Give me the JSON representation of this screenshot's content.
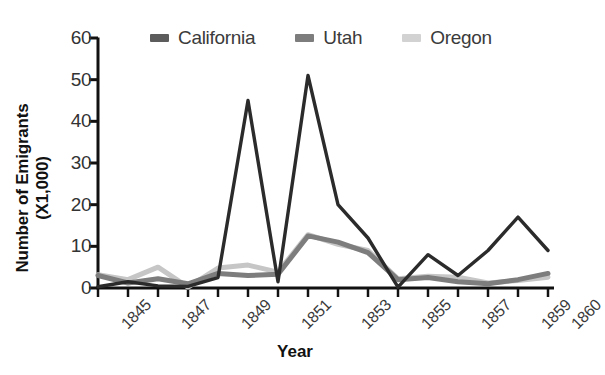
{
  "chart_data": {
    "type": "line",
    "title": "",
    "xlabel": "Year",
    "ylabel_line1": "Number of Emigrants",
    "ylabel_line2": "(X1,000)",
    "x": [
      1845,
      1846,
      1847,
      1848,
      1849,
      1850,
      1851,
      1852,
      1853,
      1854,
      1855,
      1856,
      1857,
      1858,
      1859,
      1860
    ],
    "xtick_labels": [
      "1845",
      "1847",
      "1849",
      "1851",
      "1853",
      "1855",
      "1857",
      "1859",
      "1860"
    ],
    "xtick_values": [
      1845,
      1847,
      1849,
      1851,
      1853,
      1855,
      1857,
      1859,
      1860
    ],
    "ylim": [
      0,
      60
    ],
    "xlim": [
      1845,
      1860
    ],
    "ytick_labels": [
      "0",
      "10",
      "20",
      "30",
      "40",
      "50",
      "60"
    ],
    "ytick_values": [
      0,
      10,
      20,
      30,
      40,
      50,
      60
    ],
    "grid": false,
    "legend_position": "top",
    "series": [
      {
        "name": "California",
        "color": "#2b2b2b",
        "values": [
          0.3,
          1.5,
          0.5,
          0.4,
          2.5,
          45,
          1.5,
          51,
          20,
          12,
          0.2,
          8,
          3,
          9,
          17,
          9
        ]
      },
      {
        "name": "Utah",
        "color": "#7d7d7d",
        "values": [
          3.0,
          1.2,
          2.2,
          1.0,
          3.5,
          3.0,
          3.3,
          12.5,
          11.0,
          8.5,
          2.0,
          2.5,
          1.5,
          1.0,
          2.0,
          3.5
        ]
      },
      {
        "name": "Oregon",
        "color": "#c6c6c6",
        "values": [
          3.2,
          2.0,
          5.0,
          0.2,
          4.8,
          5.5,
          3.8,
          12.8,
          10.5,
          9.0,
          2.2,
          2.8,
          2.6,
          1.2,
          1.8,
          2.6
        ]
      }
    ]
  },
  "legend": {
    "items": [
      {
        "label": "California",
        "color": "#5c5c5c"
      },
      {
        "label": "Utah",
        "color": "#7d7d7d"
      },
      {
        "label": "Oregon",
        "color": "#d2d2d2"
      }
    ]
  },
  "axis": {
    "color": "#111111"
  }
}
